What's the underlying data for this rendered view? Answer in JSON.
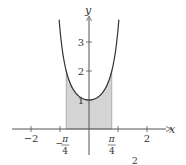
{
  "chart_data": {
    "type": "area",
    "title": "",
    "function": "y = sec^2(x)",
    "xlabel": "x",
    "ylabel": "y",
    "xlim": [
      -2.6,
      2.8
    ],
    "ylim": [
      0,
      4.3
    ],
    "grid": false,
    "x_ticks": [
      {
        "value": -2,
        "label": "−2"
      },
      {
        "value": -1,
        "label": ""
      },
      {
        "value": 1,
        "label": ""
      },
      {
        "value": 2,
        "label": "2"
      }
    ],
    "x_special_labels": [
      {
        "value": -0.7854,
        "sign": "−",
        "numerator": "π",
        "denominator": "4"
      },
      {
        "value": 0.7854,
        "sign": "",
        "numerator": "π",
        "denominator": "4"
      }
    ],
    "y_ticks": [
      {
        "value": 1,
        "label": "1"
      },
      {
        "value": 2,
        "label": "2"
      },
      {
        "value": 3,
        "label": "3"
      }
    ],
    "curve": {
      "x_range": [
        -1.03,
        1.03
      ],
      "points": [
        {
          "x": -1.03,
          "y": 3.72
        },
        {
          "x": -0.7854,
          "y": 2.0
        },
        {
          "x": -0.5,
          "y": 1.3
        },
        {
          "x": 0,
          "y": 1.0
        },
        {
          "x": 0.5,
          "y": 1.3
        },
        {
          "x": 0.7854,
          "y": 2.0
        },
        {
          "x": 1.03,
          "y": 3.72
        }
      ]
    },
    "shaded_region": {
      "x_from": -0.7854,
      "x_to": 0.7854,
      "under": "curve",
      "above": "x-axis"
    },
    "colors": {
      "curve": "#333333",
      "fill": "#d4d4d4",
      "axis": "#555555",
      "text": "#333333"
    },
    "caption_fragment": "2"
  }
}
